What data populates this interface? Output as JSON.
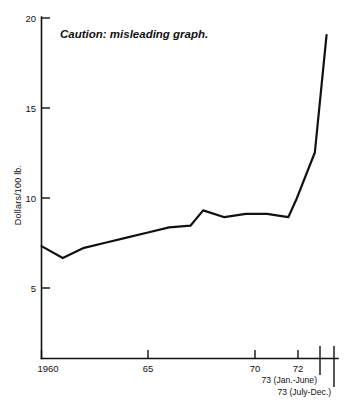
{
  "chart_data": {
    "type": "line",
    "title": "",
    "annotation": "Caution: misleading graph.",
    "xlabel": "",
    "ylabel": "Dollars/100 lb.",
    "ylim": [
      0,
      20
    ],
    "xlim": [
      1960,
      1973.75
    ],
    "grid": false,
    "legend": "none",
    "y_ticks": [
      {
        "value": 20,
        "label": "20"
      },
      {
        "value": 15,
        "label": "15"
      },
      {
        "value": 10,
        "label": "10"
      },
      {
        "value": 5,
        "label": "5"
      }
    ],
    "x_ticks": [
      {
        "value": 1960,
        "label": "1960"
      },
      {
        "value": 1965,
        "label": "65"
      },
      {
        "value": 1970,
        "label": "70"
      },
      {
        "value": 1972,
        "label": "72"
      },
      {
        "value": 1972.85,
        "label": ""
      },
      {
        "value": 1973.4,
        "label": ""
      }
    ],
    "x": [
      1960,
      1961,
      1962,
      1963,
      1964,
      1965,
      1966,
      1967,
      1967.6,
      1968.6,
      1969.6,
      1970.6,
      1971.6,
      1972,
      1972.85,
      1973.4
    ],
    "values": [
      6.6,
      5.9,
      6.5,
      6.8,
      7.1,
      7.4,
      7.7,
      7.8,
      8.7,
      8.3,
      8.5,
      8.5,
      8.3,
      9.4,
      12.1,
      19.0
    ],
    "series": [
      {
        "name": "Price",
        "values": [
          6.6,
          5.9,
          6.5,
          6.8,
          7.1,
          7.4,
          7.7,
          7.8,
          8.7,
          8.3,
          8.5,
          8.5,
          8.3,
          9.4,
          12.1,
          19.0
        ]
      }
    ],
    "period_labels": [
      "73 (Jan.-June)",
      "73 (July-Dec.)"
    ],
    "line_color": "#111111",
    "background_color": "#ffffff"
  }
}
